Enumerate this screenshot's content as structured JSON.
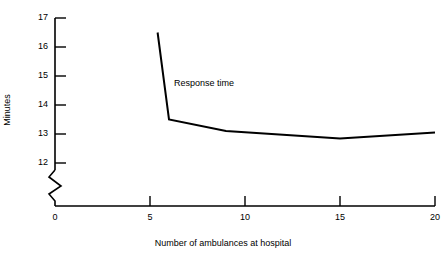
{
  "chart_data": {
    "type": "line",
    "title": "",
    "xlabel": "Number of ambulances at hospital",
    "ylabel": "Minutes",
    "xlim": [
      0,
      20
    ],
    "ylim": [
      12,
      17
    ],
    "grid": false,
    "legend": "none",
    "y_axis_break": true,
    "y_axis_break_note": "axis broken between 0 and 12",
    "x_ticks": [
      "0",
      "5",
      "10",
      "15",
      "20"
    ],
    "x_tick_values": [
      0,
      5,
      10,
      15,
      20
    ],
    "y_ticks": [
      "12",
      "13",
      "14",
      "15",
      "16",
      "17"
    ],
    "y_tick_values": [
      12,
      13,
      14,
      15,
      16,
      17
    ],
    "y_origin_label": "0",
    "series": [
      {
        "name": "Response time",
        "annotation": "Response time",
        "x": [
          5.4,
          6.0,
          9.0,
          15.0,
          20.0
        ],
        "values": [
          16.5,
          13.5,
          13.1,
          12.85,
          13.05
        ]
      }
    ]
  },
  "axes": {
    "y_title": "Minutes",
    "x_title": "Number of ambulances at hospital",
    "origin_label": "0"
  },
  "annotations": {
    "response_time": "Response time"
  },
  "colors": {
    "line": "#000000",
    "axis": "#000000",
    "background": "#ffffff"
  }
}
